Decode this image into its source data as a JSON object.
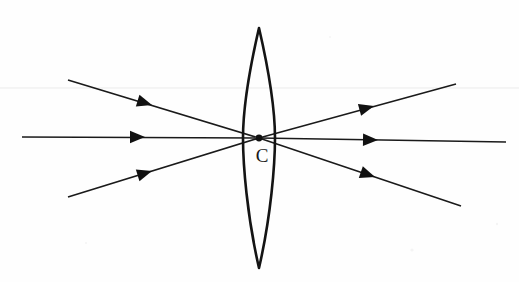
{
  "figure": {
    "kind": "optics-ray-diagram",
    "width": 519,
    "height": 282,
    "background_color": "#fefefe",
    "ink_color": "#1a1a1a",
    "lens_stroke_color": "#141414",
    "guide_color": "#ebebeb"
  },
  "labels": {
    "focal_point": "C"
  },
  "lens": {
    "name": "biconvex-converging-lens",
    "center_x": 259,
    "top_tip_y": 28,
    "bottom_tip_y": 268,
    "half_width": 16,
    "left_edge_x": 243,
    "right_edge_x": 275,
    "outline_path": "M 259 28 C 247 80 243 112 243 138 C 243 164 247 216 259 268 C 271 216 275 164 275 138 C 275 112 271 80 259 28 Z"
  },
  "focal_point": {
    "name": "focal-point-C",
    "x": 259,
    "y": 138,
    "radius": 3.4,
    "label": "C",
    "label_x": 262,
    "label_y": 158
  },
  "guides": [
    {
      "name": "faint-horizontal-guide",
      "x1": 0,
      "y1": 88,
      "x2": 519,
      "y2": 88
    }
  ],
  "rays": [
    {
      "name": "incident-ray-upper",
      "side": "incident",
      "x1": 68,
      "y1": 80,
      "x2": 259,
      "y2": 138,
      "arrow_x": 152,
      "arrow_y": 105,
      "arrow_angle_deg": 17
    },
    {
      "name": "incident-ray-axial",
      "side": "incident",
      "x1": 22,
      "y1": 137,
      "x2": 259,
      "y2": 138,
      "arrow_x": 145,
      "arrow_y": 137,
      "arrow_angle_deg": 0
    },
    {
      "name": "incident-ray-lower",
      "side": "incident",
      "x1": 68,
      "y1": 197,
      "x2": 259,
      "y2": 138,
      "arrow_x": 152,
      "arrow_y": 171,
      "arrow_angle_deg": -17
    },
    {
      "name": "emergent-ray-upper",
      "side": "emergent",
      "x1": 259,
      "y1": 138,
      "x2": 456,
      "y2": 84,
      "arrow_x": 374,
      "arrow_y": 106,
      "arrow_angle_deg": -15
    },
    {
      "name": "emergent-ray-axial",
      "side": "emergent",
      "x1": 259,
      "y1": 138,
      "x2": 506,
      "y2": 142,
      "arrow_x": 378,
      "arrow_y": 140,
      "arrow_angle_deg": 1
    },
    {
      "name": "emergent-ray-lower",
      "side": "emergent",
      "x1": 259,
      "y1": 138,
      "x2": 461,
      "y2": 206,
      "arrow_x": 375,
      "arrow_y": 177,
      "arrow_angle_deg": 19
    }
  ],
  "specks": [
    {
      "x": 412,
      "y": 250,
      "r": 1.6
    },
    {
      "x": 497,
      "y": 224,
      "r": 1.2
    },
    {
      "x": 86,
      "y": 243,
      "r": 1.1
    },
    {
      "x": 330,
      "y": 37,
      "r": 1.0
    }
  ]
}
